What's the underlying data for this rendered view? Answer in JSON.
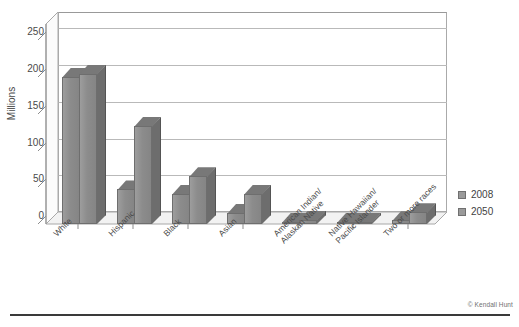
{
  "chart_data": {
    "type": "bar",
    "title": "",
    "subtitle": "",
    "xlabel": "",
    "ylabel": "Millions",
    "ylim": [
      0,
      250
    ],
    "ytick_labels": [
      "0",
      "50",
      "100",
      "150",
      "200",
      "250"
    ],
    "ytick_values": [
      0,
      50,
      100,
      150,
      200,
      250
    ],
    "grid": true,
    "legend_position": "right",
    "threed": true,
    "categories": [
      "White",
      "Hispanic",
      "Black",
      "Asian",
      "American Indian/\nAlaskan Native",
      "Native Hawaiian/\nPacific Islander",
      "Two or more races"
    ],
    "series": [
      {
        "name": "2008",
        "color": "#9a9a9a",
        "values": [
          200,
          47,
          41,
          15,
          3,
          1,
          5
        ]
      },
      {
        "name": "2050",
        "color": "#9a9a9a",
        "values": [
          204,
          133,
          65,
          41,
          6,
          3,
          16
        ]
      }
    ],
    "annotations": [
      "© Kendall Hunt"
    ]
  },
  "axis": {
    "y_title": "Millions",
    "ticks": [
      "250",
      "200",
      "150",
      "100",
      "50",
      "0"
    ]
  },
  "legend": {
    "items": [
      {
        "label": "2008"
      },
      {
        "label": "2050"
      }
    ]
  },
  "credit": {
    "text": "© Kendall Hunt"
  }
}
